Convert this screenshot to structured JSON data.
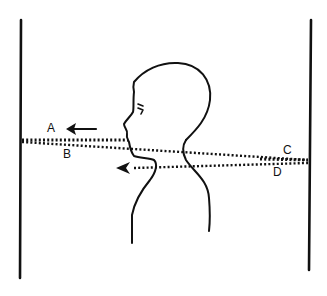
{
  "diagram": {
    "title": "",
    "labels": {
      "a": "A",
      "b": "B",
      "c": "C",
      "d": "D"
    },
    "colors": {
      "ink": "#111111",
      "background": "#ffffff"
    },
    "elements": {
      "left_wall": "wall",
      "right_wall": "wall",
      "person": "head-and-shoulders profile facing left",
      "path_ab": "dotted path from left wall (A/B) to right wall (C)",
      "path_d": "dotted path from right wall (D) leftward, ending in arrow at neck",
      "arrow_a": "arrow pointing left near label A",
      "arrow_d": "arrowhead pointing left near neck"
    }
  }
}
